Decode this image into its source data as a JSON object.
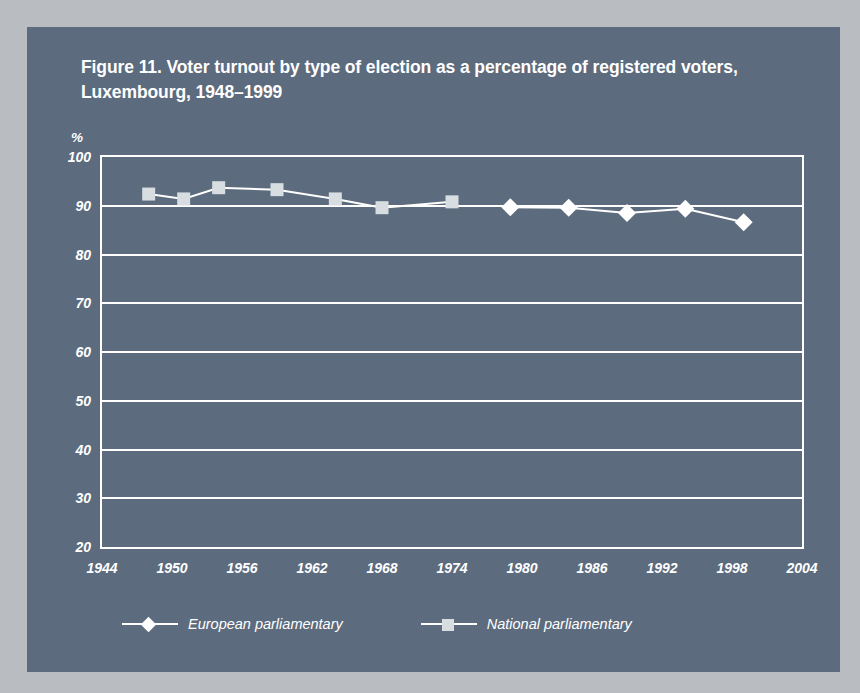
{
  "figure": {
    "title": "Figure 11. Voter turnout by type of election as a percentage of  registered voters, Luxembourg, 1948–1999",
    "panel_color": "#5c6b7d",
    "outer_color": "#b9bcc0",
    "ink_color": "#ffffff"
  },
  "chart_data": {
    "type": "line",
    "title": "Figure 11. Voter turnout by type of election as a percentage of  registered voters, Luxembourg, 1948–1999",
    "xlabel": "",
    "ylabel": "%",
    "xlim": [
      1944,
      2004
    ],
    "ylim": [
      20,
      100
    ],
    "xticks": [
      1944,
      1950,
      1956,
      1962,
      1968,
      1974,
      1980,
      1986,
      1992,
      1998,
      2004
    ],
    "yticks": [
      20,
      30,
      40,
      50,
      60,
      70,
      80,
      90,
      100
    ],
    "grid": "horizontal",
    "legend_position": "bottom-left",
    "series": [
      {
        "name": "European parliamentary",
        "marker": "diamond",
        "color": "#ffffff",
        "points": [
          {
            "x": 1979,
            "y": 89.7
          },
          {
            "x": 1984,
            "y": 89.6
          },
          {
            "x": 1989,
            "y": 88.5
          },
          {
            "x": 1994,
            "y": 89.4
          },
          {
            "x": 1999,
            "y": 86.6
          }
        ]
      },
      {
        "name": "National parliamentary",
        "marker": "square",
        "color": "#d8dde2",
        "points": [
          {
            "x": 1948,
            "y": 92.4
          },
          {
            "x": 1951,
            "y": 91.4
          },
          {
            "x": 1954,
            "y": 93.7
          },
          {
            "x": 1959,
            "y": 93.3
          },
          {
            "x": 1964,
            "y": 91.4
          },
          {
            "x": 1968,
            "y": 89.6
          },
          {
            "x": 1974,
            "y": 90.8
          }
        ]
      }
    ]
  },
  "axes": {
    "y_unit_label": "%",
    "y_tick_labels": [
      "100",
      "90",
      "80",
      "70",
      "60",
      "50",
      "40",
      "30",
      "20"
    ],
    "x_tick_labels": [
      "1944",
      "1950",
      "1956",
      "1962",
      "1968",
      "1974",
      "1980",
      "1986",
      "1992",
      "1998",
      "2004"
    ]
  },
  "legend": {
    "items": [
      {
        "label": "European parliamentary",
        "marker": "diamond"
      },
      {
        "label": "National parliamentary",
        "marker": "square"
      }
    ]
  }
}
